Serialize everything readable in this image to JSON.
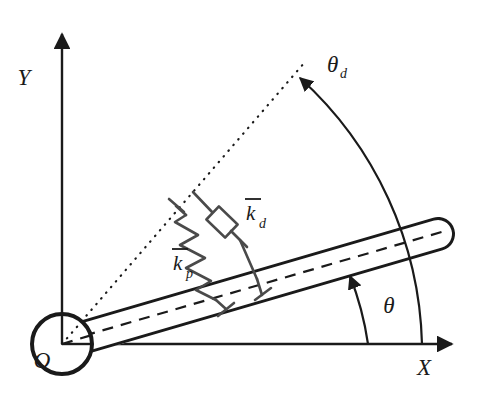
{
  "figure": {
    "type": "mechanical-schematic",
    "background_color": "#ffffff",
    "stroke_color": "#1a1a1a"
  },
  "axes": {
    "x_label": "X",
    "y_label": "Y",
    "origin_label": "O"
  },
  "angles": {
    "actual": {
      "label": "θ",
      "name": "theta",
      "meaning": "actual link angle"
    },
    "desired": {
      "label": "θ",
      "subscript": "d",
      "name": "theta-d",
      "meaning": "desired link angle"
    }
  },
  "elements": {
    "spring": {
      "label": "k",
      "overbar": true,
      "subscript": "p",
      "name": "proportional-stiffness",
      "meaning": "virtual proportional (spring) gain"
    },
    "damper": {
      "label": "k",
      "overbar": true,
      "subscript": "d",
      "name": "derivative-damping",
      "meaning": "virtual derivative (damper) gain"
    },
    "link": {
      "name": "rigid-link",
      "meaning": "rotating rigid rod"
    },
    "pivot": {
      "name": "revolute-joint",
      "meaning": "pivot circle at origin"
    },
    "desired_line": {
      "name": "desired-direction",
      "meaning": "dotted ray indicating desired angular position"
    }
  },
  "geometry": {
    "origin": {
      "x": 62,
      "y": 344
    },
    "pivot_radius": 30,
    "link_angle_deg": 18.5,
    "desired_angle_deg": 48,
    "link_tip": {
      "x": 450,
      "y": 228
    },
    "x_axis_end": {
      "x": 458,
      "y": 344
    },
    "y_axis_end": {
      "x": 62,
      "y": 28
    }
  }
}
